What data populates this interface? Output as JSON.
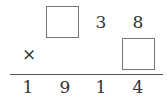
{
  "puzzle": {
    "operator": "×",
    "multiplicand": [
      "",
      "3",
      "8"
    ],
    "multiplier": [
      ""
    ],
    "product": [
      "1",
      "9",
      "1",
      "4"
    ],
    "blanks": [
      "multiplicand-hundreds",
      "multiplier-units"
    ]
  }
}
